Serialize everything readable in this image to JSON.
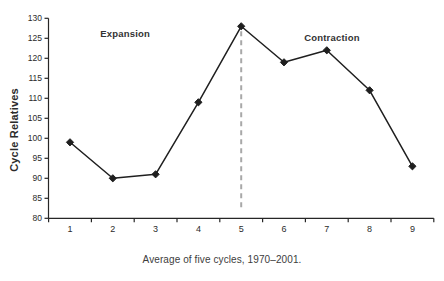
{
  "colors": {
    "background": "#ffffff",
    "axis": "#262626",
    "line": "#1f1f1f",
    "marker": "#1f1f1f",
    "divider": "#a8a8a8",
    "tick_text": "#2b2b2b",
    "annotation_text": "#333333",
    "caption_text": "#3d3d3d"
  },
  "chart_data": {
    "type": "line",
    "title": "",
    "series_name": "Cycle relatives, average of five cycles",
    "x": [
      1,
      2,
      3,
      4,
      5,
      6,
      7,
      8,
      9
    ],
    "values": [
      99,
      90,
      91,
      109,
      128,
      119,
      122,
      112,
      93
    ],
    "xlabel": "",
    "ylabel": "Cycle Relatives",
    "ylim": [
      80,
      130
    ],
    "xlim": [
      0.5,
      9.5
    ],
    "ytick_step": 5,
    "y_ticks": [
      130,
      125,
      120,
      115,
      110,
      105,
      100,
      95,
      90,
      85,
      80
    ],
    "x_ticks": [
      "1",
      "2",
      "3",
      "4",
      "5",
      "6",
      "7",
      "8",
      "9"
    ],
    "grid": false,
    "legend": false,
    "marker": "diamond",
    "divider": {
      "x_data": 5,
      "style": "dashed",
      "meaning": "peak between expansion and contraction"
    },
    "annotations": [
      {
        "text": "Expansion",
        "x_data": 2.29,
        "y_data": 126.3
      },
      {
        "text": "Contraction",
        "x_data": 7.12,
        "y_data": 125.3
      }
    ],
    "caption": "Average of five cycles, 1970–2001."
  }
}
